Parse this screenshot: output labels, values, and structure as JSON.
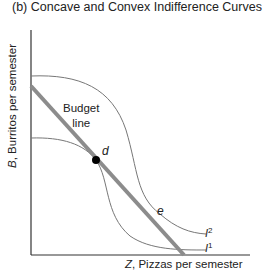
{
  "title": "(b) Concave and Convex Indifference Curves",
  "y_axis": {
    "var": "B",
    "rest": ", Burritos per semester"
  },
  "x_axis": {
    "var": "Z",
    "rest": ", Pizzas per semester"
  },
  "budget_line": {
    "label_line1": "Budget",
    "label_line2": "line",
    "color": "#8a8a8a"
  },
  "points": [
    {
      "label": "d",
      "x": 96,
      "y": 160
    },
    {
      "label": "e",
      "x": 151,
      "y": 211
    }
  ],
  "curves": [
    {
      "name": "I",
      "superscript": "2"
    },
    {
      "name": "I",
      "superscript": "1"
    }
  ],
  "colors": {
    "axis": "#333333",
    "curve": "#777777",
    "budget": "#8c8c8c",
    "point": "#000000"
  }
}
